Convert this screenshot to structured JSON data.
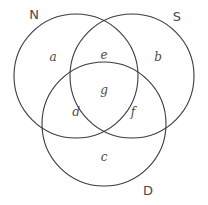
{
  "figure": {
    "type": "venn-diagram-3-set",
    "width": 208,
    "height": 205,
    "background_color": "#ffffff",
    "stroke_color": "#3a3a3a",
    "text_color": "#4a4a4a"
  },
  "sets": [
    {
      "id": "N",
      "label": "N",
      "cx": 76,
      "cy": 76,
      "r": 62,
      "label_x": 34,
      "label_y": 14
    },
    {
      "id": "S",
      "label": "S",
      "cx": 132,
      "cy": 76,
      "r": 62,
      "label_x": 177,
      "label_y": 16
    },
    {
      "id": "D",
      "label": "D",
      "cx": 104,
      "cy": 124,
      "r": 62,
      "label_x": 148,
      "label_y": 190
    }
  ],
  "regions": [
    {
      "id": "a",
      "label": "a",
      "belongs_to": "N only",
      "x": 53,
      "y": 57
    },
    {
      "id": "b",
      "label": "b",
      "belongs_to": "S only",
      "x": 158,
      "y": 57
    },
    {
      "id": "c",
      "label": "c",
      "belongs_to": "D only",
      "x": 104,
      "y": 157
    },
    {
      "id": "d",
      "label": "d",
      "belongs_to": "N and D",
      "x": 76,
      "y": 112
    },
    {
      "id": "e",
      "label": "e",
      "belongs_to": "N and S",
      "x": 104,
      "y": 55
    },
    {
      "id": "f",
      "label": "f",
      "belongs_to": "S and D",
      "x": 133,
      "y": 112
    },
    {
      "id": "g",
      "label": "g",
      "belongs_to": "N and S and D",
      "x": 104,
      "y": 90
    }
  ]
}
